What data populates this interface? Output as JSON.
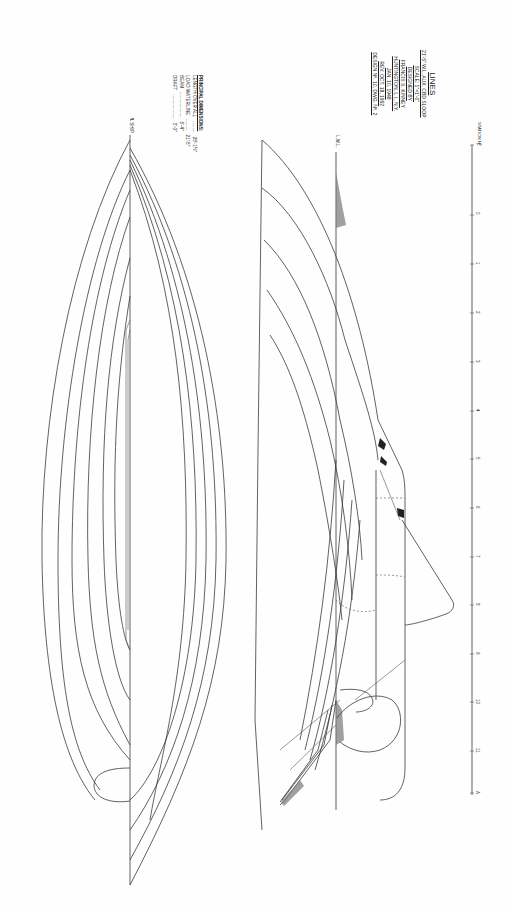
{
  "drawing": {
    "type": "lines plan",
    "orientation": "rotated 90 degrees clockwise"
  },
  "principal_dimensions": {
    "heading": "PRINCIPAL DIMENSIONS:",
    "rows": [
      {
        "label": "LENGTH OVER ALL",
        "value": "28'-1½\""
      },
      {
        "label": "LOAD WATERLINE",
        "value": "21'-5\""
      },
      {
        "label": "BEAM",
        "value": "6'-4\""
      },
      {
        "label": "DRAFT",
        "value": "3'-0\""
      }
    ]
  },
  "title_block": {
    "title": "LINES",
    "subtitle": "21'-5\" W.L. AUX. CBD SLOOP",
    "scale": "SCALE: 1\"=1'-0\"",
    "designed_by": "DESIGNED BY",
    "designer": "FRANCIS S. KINNEY",
    "location": "HUNTINGTON, L.I., N.Y.",
    "date": "JAN. 10, 1948",
    "revision": "REV. OCT. 18, 1952",
    "design_no": "DESIGN Nº. 10, DWG. Nº. 2"
  },
  "labels": {
    "centerline": "℄ SHIP",
    "lwl": "L.W.L.",
    "station_heading": "STATION Nº"
  },
  "stations": [
    "F",
    "0",
    "1",
    "2",
    "3",
    "4",
    "5",
    "6",
    "7",
    "8",
    "9",
    "10",
    "11",
    "A"
  ],
  "colors": {
    "paper": "#fefefe",
    "ink": "#3a3a3a"
  }
}
